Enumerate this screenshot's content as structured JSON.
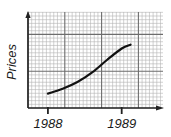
{
  "chart_data": {
    "type": "line",
    "title": "",
    "xlabel": "",
    "ylabel": "Prices",
    "x_ticks": [
      {
        "value": 1988,
        "label": "1988"
      },
      {
        "value": 1989,
        "label": "1989"
      }
    ],
    "xlim": [
      1987.73,
      1989.56
    ],
    "ylim": [
      0,
      1
    ],
    "y_units": "normalized (no numeric scale shown)",
    "grid": true,
    "grid_style": "graph paper (major and minor gridlines)",
    "legend": "none",
    "series": [
      {
        "name": "Prices",
        "color": "#111111",
        "x": [
          1988.0,
          1988.2,
          1988.4,
          1988.6,
          1988.8,
          1989.0,
          1989.12
        ],
        "y": [
          0.15,
          0.2,
          0.27,
          0.37,
          0.5,
          0.62,
          0.66
        ]
      }
    ],
    "colors": {
      "axis": "#222222",
      "major_grid": "#6d6d6d",
      "minor_grid": "#b4b4b4",
      "curve": "#111111",
      "text": "#1a1a1a"
    }
  }
}
